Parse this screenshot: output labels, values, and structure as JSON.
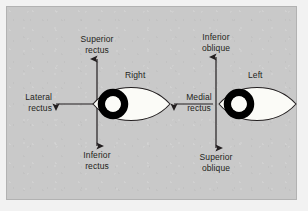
{
  "figure": {
    "background_color": "#f2f2f2",
    "panel_color": "#c9c9c9",
    "ink_color": "#231f20",
    "sclera_color": "#fbfbf7",
    "pupil_color": "#000000"
  },
  "eyes": [
    {
      "id": "right-eye",
      "name": "Right"
    },
    {
      "id": "left-eye",
      "name": "Left"
    }
  ],
  "muscle_labels": {
    "superior_rectus": {
      "line1": "Superior",
      "line2": "rectus"
    },
    "inferior_rectus": {
      "line1": "Inferior",
      "line2": "rectus"
    },
    "lateral_rectus": {
      "line1": "Lateral",
      "line2": "rectus"
    },
    "medial_rectus": {
      "line1": "Medial",
      "line2": "rectus"
    },
    "inferior_oblique": {
      "line1": "Inferior",
      "line2": "oblique"
    },
    "superior_oblique": {
      "line1": "Superior",
      "line2": "oblique"
    }
  },
  "arrows": [
    {
      "name": "superior-rectus-arrow",
      "direction": "up",
      "eye": "right"
    },
    {
      "name": "inferior-rectus-arrow",
      "direction": "down",
      "eye": "right"
    },
    {
      "name": "lateral-rectus-arrow",
      "direction": "left",
      "eye": "right"
    },
    {
      "name": "medial-rectus-arrow",
      "direction": "left",
      "eye": "left"
    },
    {
      "name": "inferior-oblique-arrow",
      "direction": "up",
      "eye": "left"
    },
    {
      "name": "superior-oblique-arrow",
      "direction": "down",
      "eye": "left"
    }
  ]
}
